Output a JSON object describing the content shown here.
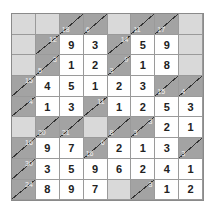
{
  "puzzle": {
    "type": "kakuro",
    "rows": 9,
    "cols": 8,
    "colors": {
      "blank": "#d9d9d9",
      "clue": "#a3a3a3",
      "value": "#ffffff",
      "clue_text": "#f2f2f2"
    },
    "grid": [
      [
        {
          "t": "blank"
        },
        {
          "t": "blank"
        },
        {
          "t": "clue",
          "down": "18"
        },
        {
          "t": "clue",
          "down": "6"
        },
        {
          "t": "blank"
        },
        {
          "t": "clue",
          "down": "11"
        },
        {
          "t": "clue",
          "down": "17"
        },
        {
          "t": "blank"
        }
      ],
      [
        {
          "t": "blank"
        },
        {
          "t": "clue",
          "across": "12"
        },
        {
          "t": "value",
          "v": "9"
        },
        {
          "t": "value",
          "v": "3"
        },
        {
          "t": "clue",
          "across": "14"
        },
        {
          "t": "value",
          "v": "5"
        },
        {
          "t": "value",
          "v": "9"
        },
        {
          "t": "blank"
        }
      ],
      [
        {
          "t": "blank"
        },
        {
          "t": "clue",
          "across": "3",
          "down": "5"
        },
        {
          "t": "value",
          "v": "1"
        },
        {
          "t": "value",
          "v": "2"
        },
        {
          "t": "clue",
          "across": "9",
          "down": "3"
        },
        {
          "t": "value",
          "v": "1"
        },
        {
          "t": "value",
          "v": "8"
        },
        {
          "t": "blank"
        }
      ],
      [
        {
          "t": "clue",
          "across": "15"
        },
        {
          "t": "value",
          "v": "4"
        },
        {
          "t": "value",
          "v": "5"
        },
        {
          "t": "value",
          "v": "1"
        },
        {
          "t": "value",
          "v": "2"
        },
        {
          "t": "value",
          "v": "3"
        },
        {
          "t": "clue",
          "down": "15"
        },
        {
          "t": "clue",
          "down": "4"
        }
      ],
      [
        {
          "t": "clue",
          "across": "4"
        },
        {
          "t": "value",
          "v": "1"
        },
        {
          "t": "value",
          "v": "3"
        },
        {
          "t": "clue",
          "across": "11"
        },
        {
          "t": "value",
          "v": "1"
        },
        {
          "t": "value",
          "v": "2"
        },
        {
          "t": "value",
          "v": "5"
        },
        {
          "t": "value",
          "v": "3"
        }
      ],
      [
        {
          "t": "blank"
        },
        {
          "t": "clue",
          "down": "20"
        },
        {
          "t": "clue",
          "down": "21"
        },
        {
          "t": "blank"
        },
        {
          "t": "clue",
          "down": "8"
        },
        {
          "t": "clue",
          "across": "3",
          "down": "3"
        },
        {
          "t": "value",
          "v": "2"
        },
        {
          "t": "value",
          "v": "1"
        }
      ],
      [
        {
          "t": "clue",
          "across": "16"
        },
        {
          "t": "value",
          "v": "9"
        },
        {
          "t": "value",
          "v": "7"
        },
        {
          "t": "clue",
          "across": "6",
          "down": "16"
        },
        {
          "t": "value",
          "v": "2"
        },
        {
          "t": "value",
          "v": "1"
        },
        {
          "t": "value",
          "v": "3"
        },
        {
          "t": "clue",
          "down": "3"
        }
      ],
      [
        {
          "t": "clue",
          "across": "30"
        },
        {
          "t": "value",
          "v": "3"
        },
        {
          "t": "value",
          "v": "5"
        },
        {
          "t": "value",
          "v": "9"
        },
        {
          "t": "value",
          "v": "6"
        },
        {
          "t": "value",
          "v": "2"
        },
        {
          "t": "value",
          "v": "4"
        },
        {
          "t": "value",
          "v": "1"
        }
      ],
      [
        {
          "t": "clue",
          "across": "24"
        },
        {
          "t": "value",
          "v": "8"
        },
        {
          "t": "value",
          "v": "9"
        },
        {
          "t": "value",
          "v": "7"
        },
        {
          "t": "blank"
        },
        {
          "t": "clue",
          "across": "3"
        },
        {
          "t": "value",
          "v": "1"
        },
        {
          "t": "value",
          "v": "2"
        }
      ]
    ]
  }
}
